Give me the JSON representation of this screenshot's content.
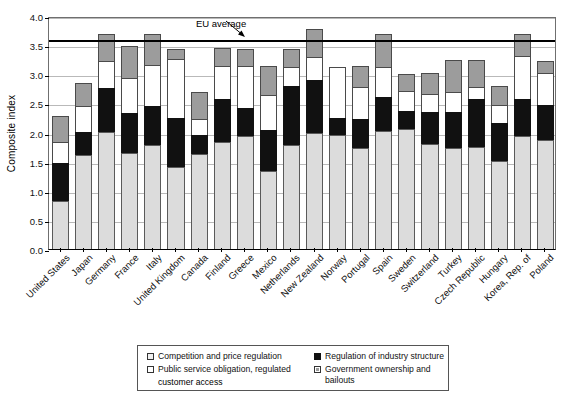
{
  "chart_data": {
    "type": "bar",
    "stacked": true,
    "title": "",
    "subtitle": "",
    "xlabel": "",
    "ylabel": "Composite index",
    "ylim": [
      0.0,
      4.0
    ],
    "ytick_step": 0.5,
    "ytick_labels": [
      "0.0",
      "0.5",
      "1.0",
      "1.5",
      "2.0",
      "2.5",
      "3.0",
      "3.5",
      "4.0"
    ],
    "grid": true,
    "grid_axis": "y",
    "legend_position": "bottom",
    "categories": [
      "United States",
      "Japan",
      "Germany",
      "France",
      "Italy",
      "United Kingdom",
      "Canada",
      "Finland",
      "Greece",
      "Mexico",
      "Netherlands",
      "New Zealand",
      "Norway",
      "Portugal",
      "Spain",
      "Sweden",
      "Switzerland",
      "Turkey",
      "Czech Republic",
      "Hungary",
      "Korea, Rep. of",
      "Poland"
    ],
    "series": [
      {
        "name": "Competition and price regulation",
        "color": "#dcdcdc",
        "values": [
          0.83,
          1.61,
          2.01,
          1.64,
          1.79,
          1.41,
          1.63,
          1.84,
          1.94,
          1.34,
          1.78,
          2.0,
          1.95,
          1.73,
          2.02,
          2.06,
          1.8,
          1.74,
          1.75,
          1.51,
          1.94,
          1.88
        ]
      },
      {
        "name": "Regulation of industry structure",
        "color": "#111111",
        "values": [
          0.64,
          0.4,
          0.76,
          0.7,
          0.67,
          0.84,
          0.32,
          0.74,
          0.48,
          0.7,
          1.02,
          0.9,
          0.3,
          0.5,
          0.59,
          0.31,
          0.56,
          0.62,
          0.82,
          0.65,
          0.64,
          0.59
        ]
      },
      {
        "name": "Public service obligation, regulated customer access",
        "color": "#ffffff",
        "values": [
          0.37,
          0.45,
          0.46,
          0.59,
          0.7,
          1.01,
          0.29,
          0.56,
          0.72,
          0.6,
          0.33,
          0.4,
          0.88,
          0.55,
          0.52,
          0.34,
          0.3,
          0.34,
          0.21,
          0.32,
          0.73,
          0.56
        ]
      },
      {
        "name": "Government ownership and bailouts",
        "color": "#9c9c9c",
        "values": [
          0.45,
          0.39,
          0.47,
          0.55,
          0.54,
          0.17,
          0.45,
          0.32,
          0.29,
          0.5,
          0.31,
          0.47,
          0.0,
          0.36,
          0.56,
          0.3,
          0.36,
          0.55,
          0.47,
          0.32,
          0.38,
          0.2
        ]
      }
    ],
    "reference_line": {
      "label": "EU average",
      "value": 3.63,
      "color": "#000000"
    }
  },
  "legend": {
    "items": [
      {
        "label": "Competition and price regulation",
        "swatch": "light-gray-swatch"
      },
      {
        "label": "Public service obligation, regulated",
        "label_line2": "customer access",
        "swatch": "white-swatch"
      },
      {
        "label": "Regulation of industry structure",
        "swatch": "black-swatch"
      },
      {
        "label": "Government ownership and bailouts",
        "swatch": "gray-swatch"
      }
    ]
  }
}
